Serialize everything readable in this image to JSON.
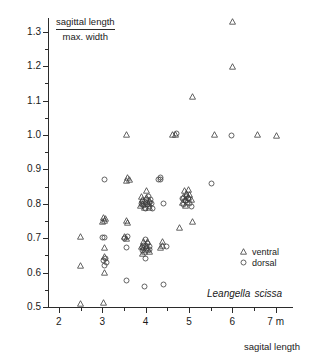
{
  "chart_data": {
    "type": "scatter",
    "title": "",
    "ylabel_numerator": "sagittal length",
    "ylabel_denominator": "max. width",
    "xlabel": "sagital length",
    "x_unit": "m",
    "annotation": "Leangella scissa",
    "annotation_genus": "Leangella",
    "annotation_species": "scissa",
    "xlim": [
      1.75,
      7.4
    ],
    "ylim": [
      0.5,
      1.34
    ],
    "grid": false,
    "legend_position": "bottom-right",
    "x_ticks_major": [
      2,
      3,
      4,
      5,
      6,
      7
    ],
    "x_tick_labels": [
      "2",
      "3",
      "4",
      "5",
      "6",
      "7 m"
    ],
    "x_ticks_minor": [
      2.5,
      3.5,
      4.5,
      5.5,
      6.5
    ],
    "y_ticks_major": [
      0.5,
      0.6,
      0.7,
      0.8,
      0.9,
      1.0,
      1.1,
      1.2,
      1.3
    ],
    "y_tick_labels": [
      "0.5",
      "0.6",
      "0.7",
      "0.8",
      "0.9",
      "1.0",
      "1.1",
      "1.2",
      "1.3"
    ],
    "y_ticks_minor": [
      0.55,
      0.65,
      0.75,
      0.85,
      0.95,
      1.05,
      1.15,
      1.25
    ],
    "series": [
      {
        "name": "ventral",
        "marker": "triangle",
        "color": "#3c3c3c",
        "points": [
          [
            2.5,
            0.51
          ],
          [
            3.03,
            0.512
          ],
          [
            2.5,
            0.62
          ],
          [
            2.5,
            0.705
          ],
          [
            3.05,
            0.6
          ],
          [
            3.05,
            0.648
          ],
          [
            3.06,
            0.672
          ],
          [
            3.0,
            0.748
          ],
          [
            3.05,
            0.752
          ],
          [
            3.08,
            0.757
          ],
          [
            3.02,
            0.76
          ],
          [
            3.55,
            0.7
          ],
          [
            3.52,
            0.706
          ],
          [
            3.58,
            0.745
          ],
          [
            3.55,
            0.752
          ],
          [
            3.55,
            0.869
          ],
          [
            3.62,
            0.872
          ],
          [
            3.58,
            0.876
          ],
          [
            3.55,
            1.0
          ],
          [
            3.92,
            0.655
          ],
          [
            3.98,
            0.662
          ],
          [
            4.04,
            0.668
          ],
          [
            3.96,
            0.674
          ],
          [
            4.02,
            0.68
          ],
          [
            3.9,
            0.676
          ],
          [
            4.08,
            0.66
          ],
          [
            3.95,
            0.69
          ],
          [
            4.05,
            0.69
          ],
          [
            3.88,
            0.795
          ],
          [
            3.94,
            0.8
          ],
          [
            4.0,
            0.806
          ],
          [
            4.06,
            0.8
          ],
          [
            3.92,
            0.812
          ],
          [
            4.02,
            0.818
          ],
          [
            3.98,
            0.788
          ],
          [
            4.08,
            0.81
          ],
          [
            3.9,
            0.82
          ],
          [
            4.1,
            0.79
          ],
          [
            4.02,
            0.838
          ],
          [
            4.35,
            0.672
          ],
          [
            4.4,
            0.678
          ],
          [
            4.38,
            0.69
          ],
          [
            4.62,
            1.0
          ],
          [
            4.68,
            1.002
          ],
          [
            4.85,
            0.805
          ],
          [
            4.92,
            0.812
          ],
          [
            4.98,
            0.818
          ],
          [
            4.88,
            0.822
          ],
          [
            4.95,
            0.83
          ],
          [
            5.02,
            0.828
          ],
          [
            4.9,
            0.838
          ],
          [
            4.98,
            0.842
          ],
          [
            5.05,
            0.812
          ],
          [
            4.92,
            0.796
          ],
          [
            4.78,
            0.73
          ],
          [
            5.08,
            0.748
          ],
          [
            5.08,
            1.112
          ],
          [
            5.58,
            1.0
          ],
          [
            6.0,
            1.33
          ],
          [
            6.0,
            1.2
          ],
          [
            6.58,
            1.0
          ],
          [
            7.02,
            0.998
          ]
        ]
      },
      {
        "name": "dorsal",
        "marker": "circle",
        "color": "#3c3c3c",
        "points": [
          [
            3.05,
            0.622
          ],
          [
            3.1,
            0.628
          ],
          [
            3.02,
            0.634
          ],
          [
            3.08,
            0.64
          ],
          [
            3.05,
            0.702
          ],
          [
            3.05,
            0.872
          ],
          [
            3.55,
            0.672
          ],
          [
            3.52,
            0.7
          ],
          [
            3.58,
            0.705
          ],
          [
            3.55,
            0.578
          ],
          [
            3.98,
            0.56
          ],
          [
            4.0,
            0.64
          ],
          [
            3.94,
            0.664
          ],
          [
            4.02,
            0.67
          ],
          [
            4.08,
            0.666
          ],
          [
            3.96,
            0.68
          ],
          [
            4.04,
            0.684
          ],
          [
            3.92,
            0.672
          ],
          [
            4.1,
            0.676
          ],
          [
            4.0,
            0.696
          ],
          [
            3.9,
            0.8
          ],
          [
            3.96,
            0.794
          ],
          [
            4.04,
            0.798
          ],
          [
            4.1,
            0.792
          ],
          [
            3.94,
            0.806
          ],
          [
            4.02,
            0.812
          ],
          [
            4.08,
            0.804
          ],
          [
            4.0,
            0.786
          ],
          [
            4.14,
            0.8
          ],
          [
            4.12,
            0.812
          ],
          [
            4.06,
            0.82
          ],
          [
            4.15,
            0.786
          ],
          [
            4.35,
            0.87
          ],
          [
            4.42,
            0.8
          ],
          [
            4.48,
            0.676
          ],
          [
            4.72,
            1.004
          ],
          [
            4.88,
            0.798
          ],
          [
            4.96,
            0.804
          ],
          [
            5.02,
            0.8
          ],
          [
            4.92,
            0.81
          ],
          [
            5.0,
            0.816
          ],
          [
            4.86,
            0.814
          ],
          [
            5.05,
            0.792
          ],
          [
            4.95,
            0.822
          ],
          [
            4.3,
            0.87
          ],
          [
            4.35,
            0.876
          ],
          [
            5.52,
            0.86
          ],
          [
            5.98,
            0.998
          ],
          [
            3.0,
            0.702
          ],
          [
            4.42,
            0.564
          ]
        ]
      }
    ]
  },
  "legend": {
    "items": [
      {
        "label": "ventral",
        "marker": "triangle"
      },
      {
        "label": "dorsal",
        "marker": "circle"
      }
    ]
  }
}
